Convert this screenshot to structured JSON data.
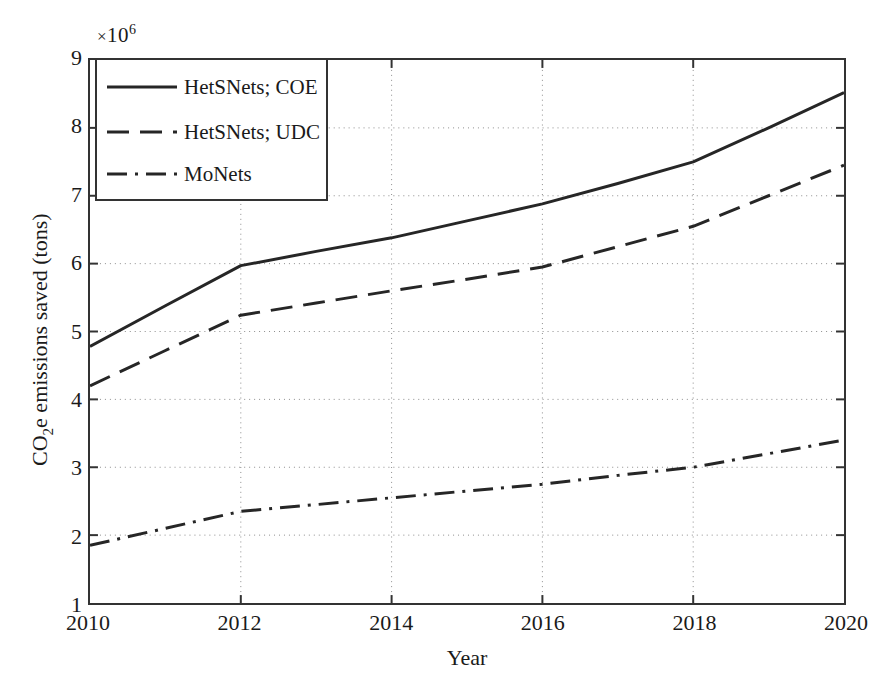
{
  "chart_data": {
    "type": "line",
    "title": "",
    "xlabel": "Year",
    "ylabel": "CO2e emissions saved (tons)",
    "ylabel_parts": {
      "pre": "CO",
      "sub": "2",
      "post": "e emissions saved (tons)"
    },
    "y_exponent": {
      "times": "×",
      "base": "10",
      "exp": "6"
    },
    "x": [
      2010,
      2011,
      2012,
      2013,
      2014,
      2015,
      2016,
      2017,
      2018,
      2019,
      2020
    ],
    "xlim": [
      2010,
      2020
    ],
    "ylim": [
      1,
      9
    ],
    "xticks": [
      2010,
      2012,
      2014,
      2016,
      2018,
      2020
    ],
    "yticks": [
      1,
      2,
      3,
      4,
      5,
      6,
      7,
      8,
      9
    ],
    "xtick_labels": [
      "2010",
      "2012",
      "2014",
      "2016",
      "2018",
      "2020"
    ],
    "ytick_labels": [
      "1",
      "2",
      "3",
      "4",
      "5",
      "6",
      "7",
      "8",
      "9"
    ],
    "grid": true,
    "grid_style": "dotted",
    "legend_position": "upper left",
    "series": [
      {
        "name": "HetSNets; COE",
        "style": "solid",
        "color": "#262626",
        "values": [
          4.78,
          5.38,
          5.97,
          6.18,
          6.38,
          6.63,
          6.88,
          7.18,
          7.5,
          8.0,
          8.52
        ]
      },
      {
        "name": "HetSNets; UDC",
        "style": "dashed",
        "color": "#262626",
        "values": [
          4.2,
          4.72,
          5.24,
          5.42,
          5.6,
          5.77,
          5.95,
          6.25,
          6.55,
          7.0,
          7.45
        ]
      },
      {
        "name": "MoNets",
        "style": "dashdot",
        "color": "#262626",
        "values": [
          1.85,
          2.1,
          2.35,
          2.45,
          2.55,
          2.65,
          2.75,
          2.88,
          3.0,
          3.2,
          3.4
        ]
      }
    ]
  },
  "legend": {
    "items": [
      {
        "label": "HetSNets; COE",
        "style": "solid"
      },
      {
        "label": "HetSNets; UDC",
        "style": "dashed"
      },
      {
        "label": "MoNets",
        "style": "dashdot"
      }
    ]
  },
  "colors": {
    "axis": "#333333",
    "grid": "#8c8c8c",
    "line": "#262626",
    "background": "#ffffff"
  }
}
